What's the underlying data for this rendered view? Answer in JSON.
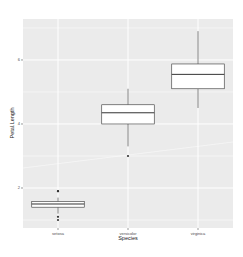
{
  "chart_data": {
    "type": "boxplot",
    "title": "",
    "xlabel": "Species",
    "ylabel": "Petal.Length",
    "categories": [
      "setosa",
      "versicolor",
      "virginica"
    ],
    "ylim": [
      0.75,
      7.28
    ],
    "yticks": [
      2,
      4,
      6
    ],
    "ytick_labels": [
      "2",
      "4",
      "6"
    ],
    "grid": true,
    "panel_background": "#ebebeb",
    "grid_color": "#ffffff",
    "box_fill": "#ffffff",
    "line_color": "#333333",
    "boxes": [
      {
        "category": "setosa",
        "lower_whisker": 1.2,
        "q1": 1.4,
        "median": 1.5,
        "q3": 1.575,
        "upper_whisker": 1.7,
        "outliers": [
          1.9,
          1.9,
          1.1,
          1.0
        ]
      },
      {
        "category": "versicolor",
        "lower_whisker": 3.3,
        "q1": 4.0,
        "median": 4.35,
        "q3": 4.6,
        "upper_whisker": 5.1,
        "outliers": [
          3.0
        ]
      },
      {
        "category": "virginica",
        "lower_whisker": 4.5,
        "q1": 5.1,
        "median": 5.55,
        "q3": 5.875,
        "upper_whisker": 6.9,
        "outliers": []
      }
    ]
  }
}
